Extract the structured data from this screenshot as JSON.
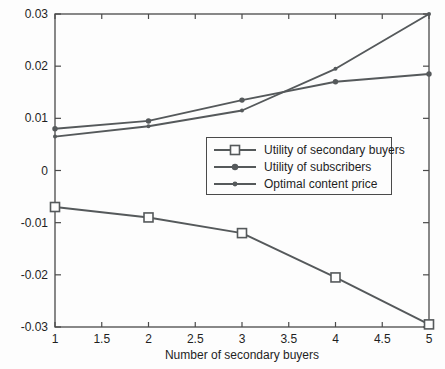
{
  "chart_data": {
    "type": "line",
    "title": "",
    "xlabel": "Number of secondary buyers",
    "ylabel": "",
    "xlim": [
      1,
      5
    ],
    "ylim": [
      -0.03,
      0.03
    ],
    "xticks": [
      1,
      1.5,
      2,
      2.5,
      3,
      3.5,
      4,
      4.5,
      5
    ],
    "yticks": [
      0.03,
      0.02,
      0.01,
      0,
      -0.01,
      -0.02,
      -0.03
    ],
    "grid": false,
    "legend_position": "inside-middle-right",
    "x": [
      1,
      2,
      3,
      4,
      5
    ],
    "series": [
      {
        "name": "Utility of secondary buyers",
        "marker": "open-square",
        "values": [
          -0.007,
          -0.009,
          -0.012,
          -0.0205,
          -0.0295
        ]
      },
      {
        "name": "Utility of subscribers",
        "marker": "dot",
        "values": [
          0.008,
          0.0095,
          0.0135,
          0.017,
          0.0185
        ]
      },
      {
        "name": "Optimal content price",
        "marker": "point",
        "values": [
          0.0065,
          0.0085,
          0.0115,
          0.0195,
          0.03
        ]
      }
    ],
    "line_color": "#55595b",
    "axis_color": "#4a4a4a",
    "text_color": "#1f1f1f",
    "background": "#fdfdfd"
  }
}
